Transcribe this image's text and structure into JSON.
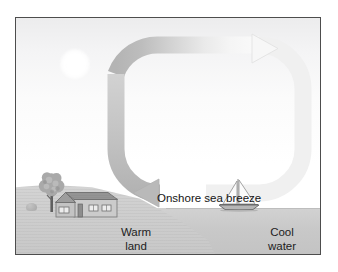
{
  "figure": {
    "type": "sea-breeze-circulation-diagram",
    "frame": {
      "border_color": "#4d4d4d"
    },
    "sky": {
      "top_color": "#ececed",
      "bottom_color": "#ffffff"
    },
    "sun": {
      "name": "sun",
      "color": "#ffffff"
    },
    "labels": {
      "breeze": "Onshore sea breeze",
      "warm_land": "Warm\nland",
      "cool_water": "Cool\nwater"
    },
    "scene_elements": {
      "tree": "tree",
      "bush": "bush",
      "house": "house",
      "sailboat": "sailboat",
      "land": "warm land surface",
      "water": "cool water surface"
    },
    "circulation": {
      "description": "Rounded rectangular convection loop",
      "arrowhead_top": "right-pointing arrowhead aloft",
      "arrowhead_bottom": "left-pointing arrowhead at surface",
      "band_color_land_side": "#b6b6b6",
      "band_color_sea_side": "#f2f2f2"
    },
    "colors": {
      "land": "#cfcfcf",
      "water": "#c9c9c9",
      "roof": "#8f8f8f",
      "wall": "#c8c8c8",
      "outline": "#6f6f6f"
    }
  }
}
